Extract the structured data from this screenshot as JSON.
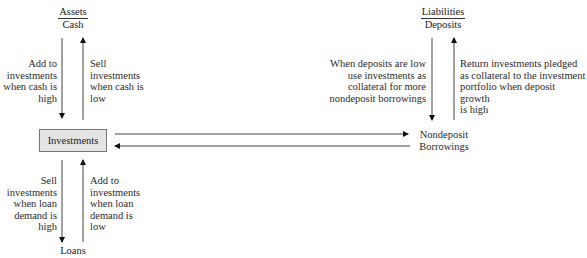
{
  "diagram": {
    "assets": {
      "heading": "Assets",
      "subheading": "Cash"
    },
    "liabilities": {
      "heading": "Liabilities",
      "subheading": "Deposits"
    },
    "center_box": {
      "label": "Investments"
    },
    "nondeposit": {
      "line1": "Nondeposit",
      "line2": "Borrowings"
    },
    "loans": {
      "label": "Loans"
    },
    "cash_flows": {
      "down": [
        "Add to",
        "investments",
        "when cash is",
        "high"
      ],
      "up": [
        "Sell",
        "investments",
        "when cash is",
        "low"
      ]
    },
    "loan_flows": {
      "down": [
        "Sell",
        "investments",
        "when loan",
        "demand is",
        "high"
      ],
      "up": [
        "Add to",
        "investments",
        "when loan",
        "demand is",
        "low"
      ]
    },
    "deposit_flows": {
      "down": [
        "When deposits are low",
        "use investments as",
        "collateral for more",
        "nondeposit borrowings"
      ],
      "up": [
        "Return investments pledged",
        "as collateral to the investment",
        "portfolio when deposit growth",
        "is high"
      ]
    }
  }
}
